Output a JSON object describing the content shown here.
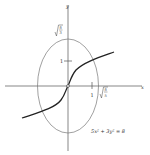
{
  "figure": {
    "type": "graph-plot",
    "axes": {
      "x_label": "x",
      "y_label": "y",
      "x_ticks": [
        {
          "value": 1,
          "label": "1"
        },
        {
          "value": 1.2649,
          "label": "√(8/5)"
        }
      ],
      "y_ticks": [
        {
          "value": 1,
          "label": "1"
        },
        {
          "value": 1.633,
          "label": "√(8/3)"
        }
      ]
    },
    "labels": {
      "x_axis": "x",
      "y_axis": "y",
      "x_tick_1": "1",
      "y_tick_1": "1",
      "x_intercept_num": "8",
      "x_intercept_den": "5",
      "y_intercept_num": "8",
      "y_intercept_den": "3",
      "equation": "5x² + 3y² = 8"
    },
    "curves": [
      {
        "name": "ellipse",
        "equation": "5x^2 + 3y^2 = 8",
        "semi_axis_x": "√(8/5)",
        "semi_axis_y": "√(8/3)"
      },
      {
        "name": "orthogonal-trajectory",
        "description": "cube-root-like curve through origin",
        "passes_through": [
          0,
          0
        ]
      }
    ],
    "colors": {
      "axis": "#555555",
      "ellipse": "#777777",
      "trajectory": "#222222",
      "text": "#333333"
    }
  }
}
